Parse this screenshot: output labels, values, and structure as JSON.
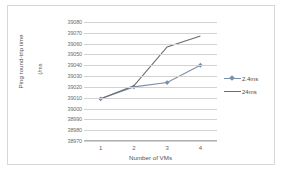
{
  "chart_data": {
    "type": "line",
    "title": "",
    "xlabel": "Number of VMs",
    "ylabel": "Ping round-trip time",
    "yunit": "(/ms",
    "categories": [
      "1",
      "2",
      "3",
      "4"
    ],
    "x": [
      1,
      2,
      3,
      4
    ],
    "ylim": [
      38970,
      39080
    ],
    "ytick_step": 10,
    "yticks": [
      "39080",
      "39070",
      "39060",
      "39050",
      "39040",
      "39030",
      "39020",
      "39010",
      "39000",
      "38990",
      "38980",
      "38970"
    ],
    "grid": true,
    "legend_position": "right",
    "series": [
      {
        "name": "2.4ms",
        "values": [
          39009,
          39020,
          39024,
          39040
        ],
        "color": "#7b8fa8",
        "marker": "diamond"
      },
      {
        "name": "24ms",
        "values": [
          39009,
          39021,
          39057,
          39067
        ],
        "color": "#6b6b6b",
        "marker": "none"
      }
    ]
  },
  "legend": {
    "items": [
      {
        "label": "2.4ms"
      },
      {
        "label": "24ms"
      }
    ]
  },
  "axes": {
    "x_title": "Number of VMs",
    "y_title": "Ping round-trip time",
    "y_unit": "(/ms"
  }
}
